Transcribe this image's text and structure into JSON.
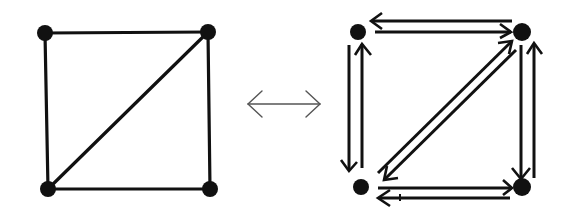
{
  "figure": {
    "colors": {
      "ink": "#111111",
      "relation_arrow": "#555555",
      "background": "#ffffff"
    },
    "left_graph": {
      "label": "Undirected graph",
      "vertices": [
        {
          "id": "a",
          "position": "top-left",
          "x": 45,
          "y": 33
        },
        {
          "id": "b",
          "position": "top-right",
          "x": 208,
          "y": 32
        },
        {
          "id": "c",
          "position": "bottom-left",
          "x": 48,
          "y": 189
        },
        {
          "id": "d",
          "position": "bottom-right",
          "x": 210,
          "y": 189
        }
      ],
      "edges": [
        {
          "from": "a",
          "to": "b"
        },
        {
          "from": "a",
          "to": "c"
        },
        {
          "from": "b",
          "to": "d"
        },
        {
          "from": "c",
          "to": "d"
        },
        {
          "from": "c",
          "to": "b"
        }
      ]
    },
    "equivalence_symbol": {
      "glyph": "⟷",
      "meaning": "double-headed arrow (equivalent)"
    },
    "right_graph": {
      "label": "Directed graph (bidirectional arcs)",
      "vertices": [
        {
          "id": "a",
          "position": "top-left",
          "x": 358,
          "y": 32
        },
        {
          "id": "b",
          "position": "top-right",
          "x": 522,
          "y": 32
        },
        {
          "id": "c",
          "position": "bottom-left",
          "x": 361,
          "y": 187
        },
        {
          "id": "d",
          "position": "bottom-right",
          "x": 522,
          "y": 187
        }
      ],
      "arcs": [
        {
          "from": "b",
          "to": "a"
        },
        {
          "from": "a",
          "to": "b"
        },
        {
          "from": "a",
          "to": "c"
        },
        {
          "from": "c",
          "to": "a"
        },
        {
          "from": "c",
          "to": "b"
        },
        {
          "from": "b",
          "to": "c"
        },
        {
          "from": "b",
          "to": "d"
        },
        {
          "from": "d",
          "to": "b"
        },
        {
          "from": "c",
          "to": "d"
        },
        {
          "from": "d",
          "to": "c"
        }
      ]
    }
  }
}
